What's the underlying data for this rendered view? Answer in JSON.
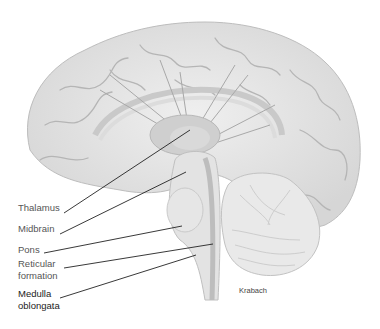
{
  "figure": {
    "colors": {
      "background": "#ffffff",
      "cortex_fill": "#e6e6e6",
      "cortex_shadow": "#c4c4c4",
      "gyri_line": "#b0b0b0",
      "structure_fill": "#cfcfcf",
      "brainstem_fill": "#e2e2e2",
      "cerebellum_fill": "#e8e8e8",
      "leader_line": "#222222",
      "label_text": "#555555"
    }
  },
  "labels": [
    {
      "id": "thalamus",
      "text": "Thalamus",
      "x": 18,
      "y": 207,
      "line_from": [
        64,
        213
      ],
      "line_to": [
        190,
        130
      ]
    },
    {
      "id": "midbrain",
      "text": "Midbrain",
      "x": 18,
      "y": 228,
      "line_from": [
        60,
        234
      ],
      "line_to": [
        186,
        172
      ]
    },
    {
      "id": "pons",
      "text": "Pons",
      "x": 18,
      "y": 249,
      "line_from": [
        44,
        253
      ],
      "line_to": [
        182,
        226
      ]
    },
    {
      "id": "reticular",
      "text": "Reticular",
      "x": 18,
      "y": 263,
      "line_from": [
        64,
        268
      ],
      "line_to": [
        213,
        244
      ]
    },
    {
      "id": "reticular2",
      "text": "formation",
      "x": 18,
      "y": 275
    },
    {
      "id": "medulla",
      "text": "Medulla",
      "x": 18,
      "y": 293,
      "line_from": [
        60,
        298
      ],
      "line_to": [
        196,
        255
      ]
    },
    {
      "id": "medulla2",
      "text": "oblongata",
      "x": 18,
      "y": 305
    }
  ],
  "credit": {
    "text": "Krabach",
    "x": 239,
    "y": 290
  }
}
